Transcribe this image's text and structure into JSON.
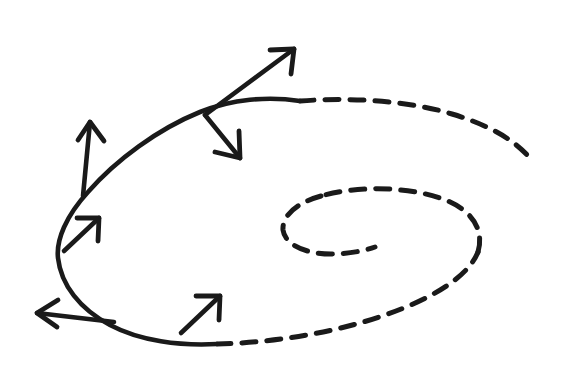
{
  "figure": {
    "type": "hand-drawn line diagram",
    "background_color": "#ffffff",
    "stroke_color": "#1a1a1a",
    "canvas": {
      "width": 562,
      "height": 376
    },
    "caption": ""
  },
  "curves": [
    {
      "name": "spiral-solid-segment",
      "style": "solid",
      "description": "Solid portion of the outward spiral running from upper-right through the left turn to the lower middle",
      "stroke_color": "#1a1a1a",
      "stroke_width": 4.6,
      "path": "M 300 101 C 268 96 232 99 200 112 C 158 129 116 160 88 192 C 66 216 56 240 58 258 C 61 285 80 309 110 325 C 140 341 180 346 217 344"
    },
    {
      "name": "spiral-dashed-outer-upper",
      "style": "dashed",
      "description": "Dashed continuation of the outer spiral from the top center around the right side, trailing off at lower right",
      "stroke_color": "#1a1a1a",
      "stroke_width": 5.0,
      "dash_pattern": "14 11",
      "path": "M 300 101 C 352 97 410 101 452 114 C 492 126 518 142 533 162"
    },
    {
      "name": "spiral-dashed-outer-lower",
      "style": "dashed",
      "description": "Dashed outer spiral arc sweeping from the bottom center rightward and curving upward",
      "stroke_color": "#1a1a1a",
      "stroke_width": 5.0,
      "dash_pattern": "14 11",
      "path": "M 217 344 C 268 343 330 334 382 316 C 432 299 468 277 478 252"
    },
    {
      "name": "spiral-dashed-inner-first-turn",
      "style": "dashed",
      "description": "Dashed inner spiral turn descending from the right side toward the inner loop",
      "stroke_color": "#1a1a1a",
      "stroke_width": 5.0,
      "dash_pattern": "14 11",
      "path": "M 478 252 C 485 228 470 208 440 198 C 404 186 356 186 321 196"
    },
    {
      "name": "spiral-dashed-inner-core",
      "style": "dashed",
      "description": "Innermost dashed coil of the spiral terminating near the center",
      "stroke_color": "#1a1a1a",
      "stroke_width": 5.0,
      "dash_pattern": "14 11",
      "path": "M 321 196 C 296 203 282 216 283 230 C 285 245 306 254 331 254 C 348 254 364 251 375 247"
    }
  ],
  "arrows": [
    {
      "name": "normal-arrow-upper-left",
      "label": "",
      "description": "Long arrow from the curve at the upper left pointing up and slightly right",
      "origin": {
        "x": 83,
        "y": 196
      },
      "tip": {
        "x": 90,
        "y": 122
      },
      "head_left": {
        "x": 78,
        "y": 140
      },
      "head_right": {
        "x": 104,
        "y": 141
      }
    },
    {
      "name": "tangent-arrow-upper-right",
      "label": "",
      "description": "Long arrow from the curve junction pointing up and to the right",
      "origin": {
        "x": 205,
        "y": 115
      },
      "tip": {
        "x": 294,
        "y": 49
      },
      "head_left": {
        "x": 270,
        "y": 50
      },
      "head_right": {
        "x": 291,
        "y": 74
      }
    },
    {
      "name": "normal-arrow-inward-right",
      "label": "",
      "description": "Arrow from the same curve junction pointing down and to the right, into the spiral",
      "origin": {
        "x": 205,
        "y": 115
      },
      "tip": {
        "x": 240,
        "y": 158
      },
      "head_left": {
        "x": 215,
        "y": 152
      },
      "head_right": {
        "x": 239,
        "y": 131
      }
    },
    {
      "name": "tangent-arrow-left-small",
      "label": "",
      "description": "Short arrow on the left side of the curve pointing up and to the right",
      "origin": {
        "x": 64,
        "y": 251
      },
      "tip": {
        "x": 99,
        "y": 218
      },
      "head_left": {
        "x": 77,
        "y": 218
      },
      "head_right": {
        "x": 98,
        "y": 241
      }
    },
    {
      "name": "normal-arrow-lower-left",
      "label": "",
      "description": "Arrow from the lower left of the curve pointing to the left",
      "origin": {
        "x": 114,
        "y": 322
      },
      "tip": {
        "x": 37,
        "y": 313
      },
      "head_left": {
        "x": 58,
        "y": 300
      },
      "head_right": {
        "x": 57,
        "y": 327
      }
    },
    {
      "name": "tangent-arrow-bottom-small",
      "label": "",
      "description": "Short arrow on the bottom of the curve pointing up and to the right",
      "origin": {
        "x": 181,
        "y": 333
      },
      "tip": {
        "x": 220,
        "y": 296
      },
      "head_left": {
        "x": 196,
        "y": 296
      },
      "head_right": {
        "x": 219,
        "y": 320
      }
    }
  ]
}
